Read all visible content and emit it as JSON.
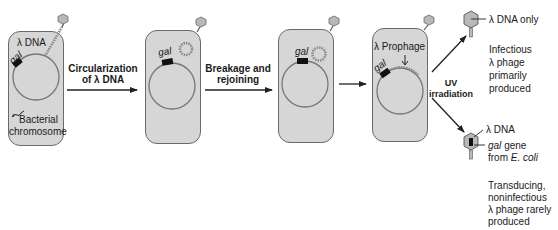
{
  "cells": [
    {
      "id": "cell-1",
      "top_label": "λ DNA",
      "gene_label": "gal",
      "bottom_label_line1": "Bacterial",
      "bottom_label_line2": "chromosome"
    },
    {
      "id": "cell-2",
      "gene_label": "gal"
    },
    {
      "id": "cell-3",
      "gene_label": "gal"
    },
    {
      "id": "cell-4",
      "top_label": "λ Prophage",
      "gene_label": "gal"
    }
  ],
  "steps": [
    {
      "line1": "Circularization",
      "line2": "of λ DNA"
    },
    {
      "line1": "Breakage and",
      "line2": "rejoining"
    },
    {
      "line1": "UV",
      "line2": "irradiation"
    }
  ],
  "outcomes": {
    "top": {
      "phage_label": "λ DNA only",
      "desc_lines": [
        "Infectious",
        "λ phage",
        "primarily",
        "produced"
      ]
    },
    "bottom": {
      "phage_label": "λ DNA",
      "gene_label_italic": "gal",
      "gene_label_rest": " gene",
      "source_prefix": "from ",
      "source_italic": "E. coli",
      "desc_lines": [
        "Transducing,",
        "noninfectious",
        "λ phage rarely",
        "produced"
      ]
    }
  },
  "colors": {
    "cell_fill": "#d6d6d6",
    "cell_border": "#6a6a6a",
    "dna": "#777777",
    "phage_head": "#b8b8b8",
    "gal_block": "#111111",
    "arrow": "#222222"
  }
}
